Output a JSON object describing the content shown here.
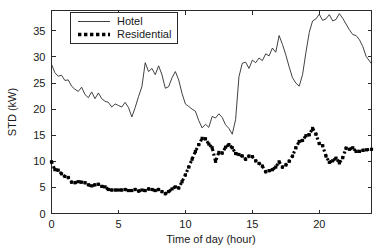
{
  "chart_data": {
    "type": "line",
    "title": "",
    "xlabel": "Time of day (hour)",
    "ylabel": "STD (kW)",
    "xlim": [
      0,
      23.9
    ],
    "ylim": [
      0,
      38.9
    ],
    "xticks": [
      0,
      5,
      10,
      15,
      20
    ],
    "yticks": [
      0,
      5,
      10,
      15,
      20,
      25,
      30,
      35
    ],
    "xtick_labels": [
      "0",
      "5",
      "10",
      "15",
      "20"
    ],
    "ytick_labels": [
      "0",
      "5",
      "10",
      "15",
      "20",
      "25",
      "30",
      "35"
    ],
    "grid": false,
    "legend_position": "top-left-inside",
    "x": [
      0,
      0.25,
      0.5,
      0.75,
      1,
      1.25,
      1.5,
      1.75,
      2,
      2.25,
      2.5,
      2.75,
      3,
      3.25,
      3.5,
      3.75,
      4,
      4.25,
      4.5,
      4.75,
      5,
      5.25,
      5.5,
      5.75,
      6,
      6.25,
      6.5,
      6.75,
      7,
      7.25,
      7.5,
      7.75,
      8,
      8.25,
      8.5,
      8.75,
      9,
      9.25,
      9.5,
      9.75,
      10,
      10.25,
      10.5,
      10.75,
      11,
      11.25,
      11.5,
      11.75,
      12,
      12.25,
      12.5,
      12.75,
      13,
      13.25,
      13.5,
      13.75,
      14,
      14.25,
      14.5,
      14.75,
      15,
      15.25,
      15.5,
      15.75,
      16,
      16.25,
      16.5,
      16.75,
      17,
      17.25,
      17.5,
      17.75,
      18,
      18.25,
      18.5,
      18.75,
      19,
      19.25,
      19.5,
      19.75,
      20,
      20.25,
      20.5,
      20.75,
      21,
      21.25,
      21.5,
      21.75,
      22,
      22.25,
      22.5,
      22.75,
      23,
      23.25,
      23.5,
      23.9
    ],
    "series": [
      {
        "name": "Hotel",
        "style": "solid-thin",
        "color": "#2b2b2b",
        "values": [
          28.6,
          27.0,
          26.3,
          26.5,
          25.5,
          25.6,
          24.4,
          23.8,
          23.4,
          24.2,
          22.8,
          22.2,
          23.3,
          22.0,
          23.1,
          22.0,
          21.5,
          21.3,
          20.4,
          21.0,
          20.7,
          20.4,
          21.3,
          20.3,
          18.5,
          20.3,
          22.4,
          24.3,
          28.9,
          27.2,
          27.8,
          26.6,
          28.3,
          26.6,
          24.0,
          24.3,
          26.0,
          27.2,
          25.6,
          23.0,
          21.0,
          20.5,
          20.0,
          19.6,
          17.8,
          16.4,
          17.1,
          16.5,
          18.6,
          18.3,
          19.1,
          18.4,
          17.0,
          16.3,
          15.2,
          18.0,
          26.2,
          28.8,
          29.0,
          27.8,
          29.4,
          28.9,
          29.8,
          29.3,
          30.6,
          30.2,
          31.7,
          30.9,
          34.1,
          32.4,
          30.4,
          28.1,
          26.0,
          25.0,
          24.4,
          26.6,
          30.8,
          34.7,
          36.9,
          37.3,
          38.2,
          37.0,
          37.3,
          38.1,
          36.9,
          37.2,
          38.3,
          37.4,
          36.3,
          35.2,
          34.3,
          34.1,
          33.3,
          32.0,
          30.1,
          28.7
        ]
      },
      {
        "name": "Residential",
        "style": "thick-dotted-square-markers",
        "color": "#000000",
        "values": [
          9.9,
          8.4,
          8.3,
          7.6,
          7.1,
          6.9,
          6.0,
          5.9,
          6.1,
          6.0,
          5.9,
          5.5,
          5.3,
          5.5,
          5.6,
          5.2,
          5.1,
          4.6,
          4.5,
          4.5,
          4.5,
          4.5,
          4.6,
          4.4,
          4.4,
          4.6,
          4.3,
          4.5,
          4.4,
          4.7,
          4.6,
          4.4,
          4.6,
          4.2,
          3.8,
          4.2,
          4.7,
          5.1,
          4.9,
          6.1,
          7.4,
          8.9,
          10.4,
          11.9,
          13.2,
          14.4,
          14.3,
          13.3,
          12.6,
          10.0,
          11.7,
          11.6,
          12.7,
          13.2,
          12.6,
          11.5,
          11.3,
          11.0,
          10.4,
          11.0,
          10.9,
          10.1,
          9.6,
          9.1,
          8.0,
          8.2,
          8.4,
          8.9,
          9.9,
          8.9,
          9.3,
          10.0,
          11.0,
          12.6,
          13.8,
          14.0,
          14.9,
          15.1,
          16.3,
          15.2,
          13.4,
          13.0,
          11.0,
          9.8,
          10.1,
          10.6,
          9.7,
          10.7,
          12.5,
          12.3,
          12.6,
          11.9,
          11.9,
          12.1,
          12.2,
          12.3
        ]
      }
    ]
  },
  "legend": {
    "entries": [
      {
        "label": "Hotel"
      },
      {
        "label": "Residential"
      }
    ]
  }
}
